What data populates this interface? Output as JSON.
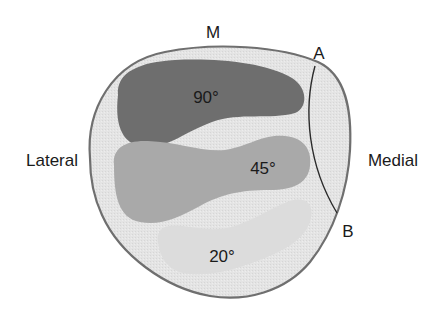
{
  "diagram": {
    "labels": {
      "top": "M",
      "left": "Lateral",
      "right": "Medial",
      "point_a": "A",
      "point_b": "B"
    },
    "zones": [
      {
        "label": "90°",
        "color": "#6e6e6e"
      },
      {
        "label": "45°",
        "color": "#a9a9a9"
      },
      {
        "label": "20°",
        "color": "#dcdcdc"
      }
    ],
    "colors": {
      "outline": "#6f6f6f",
      "outer_fill": "#e6e6e6",
      "line_ab": "#2a2a2a",
      "text": "#1a1a1a"
    }
  }
}
